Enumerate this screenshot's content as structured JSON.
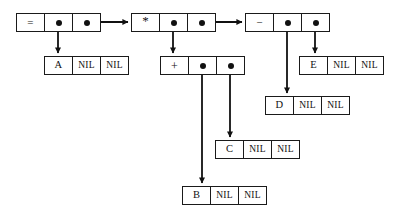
{
  "diagram": {
    "type": "linked-node-expression-tree",
    "colors": {
      "background": "#ffffff",
      "stroke": "#111111",
      "box_border": "#1a1a1a",
      "text": "#111111"
    },
    "labels": {
      "nil": "NIL",
      "pointer": "●"
    },
    "nodes": [
      {
        "id": "node-equals",
        "kind": "operator",
        "cells": [
          "=",
          "●",
          "●"
        ],
        "x": 16,
        "y": 13,
        "links": [
          "node-a",
          "node-times"
        ]
      },
      {
        "id": "node-times",
        "kind": "operator",
        "cells": [
          "*",
          "●",
          "●"
        ],
        "x": 131,
        "y": 13,
        "links": [
          "node-plus",
          "node-minus"
        ]
      },
      {
        "id": "node-minus",
        "kind": "operator",
        "cells": [
          "−",
          "●",
          "●"
        ],
        "x": 245,
        "y": 13,
        "links": [
          "node-d",
          "node-e"
        ]
      },
      {
        "id": "node-a",
        "kind": "leaf",
        "cells": [
          "A",
          "NIL",
          "NIL"
        ],
        "x": 44,
        "y": 56,
        "links": []
      },
      {
        "id": "node-plus",
        "kind": "operator",
        "cells": [
          "+",
          "●",
          "●"
        ],
        "x": 160,
        "y": 56,
        "links": [
          "node-b",
          "node-c"
        ]
      },
      {
        "id": "node-e",
        "kind": "leaf",
        "cells": [
          "E",
          "NIL",
          "NIL"
        ],
        "x": 299,
        "y": 56,
        "links": []
      },
      {
        "id": "node-d",
        "kind": "leaf",
        "cells": [
          "D",
          "NIL",
          "NIL"
        ],
        "x": 265,
        "y": 96,
        "links": []
      },
      {
        "id": "node-c",
        "kind": "leaf",
        "cells": [
          "C",
          "NIL",
          "NIL"
        ],
        "x": 215,
        "y": 140,
        "links": []
      },
      {
        "id": "node-b",
        "kind": "leaf",
        "cells": [
          "B",
          "NIL",
          "NIL"
        ],
        "x": 182,
        "y": 186,
        "links": []
      }
    ]
  }
}
